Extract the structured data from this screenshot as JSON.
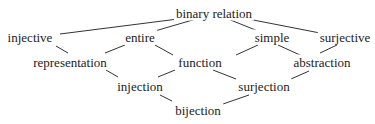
{
  "diagram": {
    "type": "lattice",
    "line_color": "#333333",
    "text_color": "#222222",
    "nodes": [
      {
        "id": "binary_relation",
        "label": "binary relation",
        "x": 214,
        "y": 13
      },
      {
        "id": "injective",
        "label": "injective",
        "x": 30,
        "y": 37
      },
      {
        "id": "entire",
        "label": "entire",
        "x": 140,
        "y": 37
      },
      {
        "id": "simple",
        "label": "simple",
        "x": 272,
        "y": 37
      },
      {
        "id": "surjective",
        "label": "surjective",
        "x": 345,
        "y": 37
      },
      {
        "id": "representation",
        "label": "representation",
        "x": 70,
        "y": 62
      },
      {
        "id": "function",
        "label": "function",
        "x": 200,
        "y": 62
      },
      {
        "id": "abstraction",
        "label": "abstraction",
        "x": 322,
        "y": 62
      },
      {
        "id": "injection",
        "label": "injection",
        "x": 140,
        "y": 86
      },
      {
        "id": "surjection",
        "label": "surjection",
        "x": 264,
        "y": 86
      },
      {
        "id": "bijection",
        "label": "bijection",
        "x": 198,
        "y": 110
      }
    ],
    "edges": [
      {
        "from": "binary_relation",
        "to": "injective",
        "x1": 178,
        "y1": 19,
        "x2": 60,
        "y2": 34
      },
      {
        "from": "binary_relation",
        "to": "entire",
        "x1": 196,
        "y1": 19,
        "x2": 155,
        "y2": 31
      },
      {
        "from": "binary_relation",
        "to": "simple",
        "x1": 228,
        "y1": 19,
        "x2": 258,
        "y2": 31
      },
      {
        "from": "binary_relation",
        "to": "surjective",
        "x1": 243,
        "y1": 18,
        "x2": 320,
        "y2": 33
      },
      {
        "from": "injective",
        "to": "representation",
        "x1": 56,
        "y1": 46,
        "x2": 68,
        "y2": 53
      },
      {
        "from": "entire",
        "to": "representation",
        "x1": 125,
        "y1": 45,
        "x2": 105,
        "y2": 53
      },
      {
        "from": "entire",
        "to": "function",
        "x1": 155,
        "y1": 45,
        "x2": 173,
        "y2": 55
      },
      {
        "from": "simple",
        "to": "function",
        "x1": 258,
        "y1": 45,
        "x2": 236,
        "y2": 55
      },
      {
        "from": "simple",
        "to": "abstraction",
        "x1": 278,
        "y1": 45,
        "x2": 300,
        "y2": 55
      },
      {
        "from": "surjective",
        "to": "abstraction",
        "x1": 337,
        "y1": 45,
        "x2": 320,
        "y2": 53
      },
      {
        "from": "representation",
        "to": "injection",
        "x1": 106,
        "y1": 70,
        "x2": 118,
        "y2": 77
      },
      {
        "from": "function",
        "to": "injection",
        "x1": 175,
        "y1": 70,
        "x2": 158,
        "y2": 77
      },
      {
        "from": "function",
        "to": "surjection",
        "x1": 213,
        "y1": 70,
        "x2": 236,
        "y2": 79
      },
      {
        "from": "abstraction",
        "to": "surjection",
        "x1": 309,
        "y1": 71,
        "x2": 291,
        "y2": 79
      },
      {
        "from": "injection",
        "to": "bijection",
        "x1": 160,
        "y1": 95,
        "x2": 172,
        "y2": 101
      },
      {
        "from": "surjection",
        "to": "bijection",
        "x1": 249,
        "y1": 95,
        "x2": 223,
        "y2": 104
      }
    ]
  }
}
